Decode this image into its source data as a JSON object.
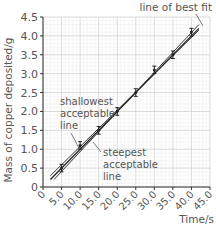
{
  "chart_data": {
    "type": "line",
    "title": "",
    "xlabel": "Time/s",
    "ylabel": "Mass of copper deposited/g",
    "xlim": [
      0,
      45
    ],
    "ylim": [
      0,
      4.5
    ],
    "x_ticks": [
      "0",
      "5.0",
      "10.0",
      "15.0",
      "20.0",
      "25.0",
      "30.0",
      "35.0",
      "40.0",
      "45.0"
    ],
    "y_ticks": [
      "0",
      "0.5",
      "1.0",
      "1.5",
      "2.0",
      "2.5",
      "3.0",
      "3.5",
      "4.0",
      "4.5"
    ],
    "grid": true,
    "series": [
      {
        "name": "data points (with error bars)",
        "x": [
          5,
          10,
          15,
          20,
          25,
          30,
          35,
          40
        ],
        "y": [
          0.5,
          1.1,
          1.5,
          2.0,
          2.5,
          3.1,
          3.5,
          4.1
        ],
        "error": 0.1
      },
      {
        "name": "line of best fit",
        "x": [
          2,
          42
        ],
        "y": [
          0.2,
          4.2
        ]
      },
      {
        "name": "shallowest acceptable line",
        "x": [
          2,
          42
        ],
        "y": [
          0.3,
          4.15
        ]
      },
      {
        "name": "steepest acceptable line",
        "x": [
          3,
          42
        ],
        "y": [
          0.2,
          4.3
        ]
      }
    ],
    "annotations": [
      "line of best fit",
      "shallowest acceptable line",
      "steepest acceptable line"
    ]
  },
  "labels": {
    "best_fit": "line of best fit",
    "shallowest": [
      "shallowest",
      "acceptable",
      "line"
    ],
    "steepest": [
      "steepest",
      "acceptable",
      "line"
    ],
    "xlabel": "Time/s",
    "ylabel": "Mass of copper deposited/g"
  }
}
